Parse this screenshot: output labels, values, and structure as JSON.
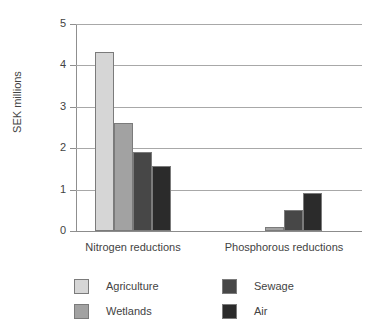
{
  "chart_data": {
    "type": "bar",
    "title": "",
    "subtitle": "",
    "xlabel": "",
    "ylabel": "SEK millions",
    "ylim": [
      0,
      5
    ],
    "yticks": [
      "0",
      "1",
      "2",
      "3",
      "4",
      "5"
    ],
    "grid": true,
    "legend_position": "bottom",
    "categories": [
      "Nitrogen reductions",
      "Phosphorous reductions"
    ],
    "series": [
      {
        "name": "Agriculture",
        "color": "#d6d6d6",
        "values": [
          4.32,
          0.0
        ]
      },
      {
        "name": "Wetlands",
        "color": "#a2a2a2",
        "values": [
          2.62,
          0.1
        ]
      },
      {
        "name": "Sewage",
        "color": "#474747",
        "values": [
          1.9,
          0.5
        ]
      },
      {
        "name": "Air",
        "color": "#2b2b2b",
        "values": [
          1.58,
          0.93
        ]
      }
    ]
  },
  "axis": {
    "y_title": "SEK millions",
    "ticks": [
      {
        "label": "5",
        "value": 5
      },
      {
        "label": "4",
        "value": 4
      },
      {
        "label": "3",
        "value": 3
      },
      {
        "label": "2",
        "value": 2
      },
      {
        "label": "1",
        "value": 1
      },
      {
        "label": "0",
        "value": 0
      }
    ]
  },
  "categories": [
    {
      "label": "Nitrogen reductions"
    },
    {
      "label": "Phosphorous reductions"
    }
  ],
  "legend": {
    "left_column": [
      {
        "label": "Agriculture",
        "color": "#d6d6d6"
      },
      {
        "label": "Wetlands",
        "color": "#a2a2a2"
      }
    ],
    "right_column": [
      {
        "label": "Sewage",
        "color": "#474747"
      },
      {
        "label": "Air",
        "color": "#2b2b2b"
      }
    ]
  }
}
